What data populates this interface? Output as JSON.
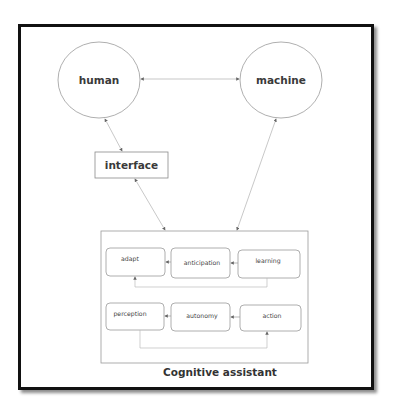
{
  "diagram": {
    "nodes": {
      "human": "human",
      "machine": "machine",
      "interface": "interface"
    },
    "assistant": {
      "caption": "Cognitive assistant",
      "top_row": [
        "adapt",
        "anticipation",
        "learning"
      ],
      "bottom_row": [
        "perception",
        "autonomy",
        "action"
      ]
    },
    "edges": [
      {
        "from": "human",
        "to": "machine",
        "type": "bidirectional"
      },
      {
        "from": "human",
        "to": "interface",
        "type": "bidirectional"
      },
      {
        "from": "interface",
        "to": "Cognitive assistant",
        "type": "bidirectional"
      },
      {
        "from": "machine",
        "to": "Cognitive assistant",
        "type": "bidirectional"
      },
      {
        "from": "anticipation",
        "to": "adapt",
        "type": "directed"
      },
      {
        "from": "learning",
        "to": "anticipation",
        "type": "directed"
      },
      {
        "from": "learning",
        "to": "adapt",
        "type": "directed"
      },
      {
        "from": "autonomy",
        "to": "perception",
        "type": "directed"
      },
      {
        "from": "action",
        "to": "autonomy",
        "type": "directed"
      },
      {
        "from": "perception",
        "to": "action",
        "type": "directed"
      }
    ],
    "colors": {
      "frame": "#111111",
      "shape_stroke": "#9a9a9a",
      "text": "#3a3a3a"
    }
  }
}
